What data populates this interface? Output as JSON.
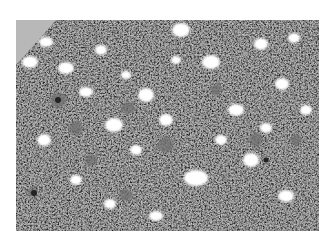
{
  "image": {
    "subject": "grayscale histology micrograph of densely cellular tissue with scattered round clear vacuoles and larger pale cells",
    "colors": {
      "background": "#ffffff",
      "tissue": "#8e8e8e",
      "nuclei": "#2a2a2a",
      "vacuole": "#ffffff",
      "corner_region": "#b4b4b4"
    }
  }
}
